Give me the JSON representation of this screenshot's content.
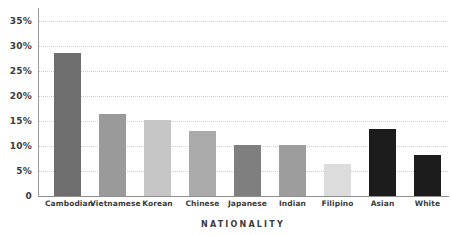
{
  "chart_data": {
    "type": "bar",
    "title": "",
    "xlabel": "NATIONALITY",
    "ylabel": "",
    "categories": [
      "Cambodian",
      "Vietnamese",
      "Korean",
      "Chinese",
      "Japanese",
      "Indian",
      "Filipino",
      "Asian",
      "White"
    ],
    "values": [
      28.7,
      16.4,
      15.2,
      13.1,
      10.3,
      10.3,
      6.5,
      13.5,
      8.3
    ],
    "bar_colors": [
      "#6e6e6e",
      "#9a9a9a",
      "#c6c6c6",
      "#aaaaaa",
      "#7f7f7f",
      "#9d9d9d",
      "#dcdcdc",
      "#1c1c1c",
      "#1c1c1c"
    ],
    "ylim": [
      0,
      37.6
    ],
    "ytick_values": [
      0,
      5,
      10,
      15,
      20,
      25,
      30,
      35
    ],
    "ytick_labels": [
      "0",
      "5%",
      "10%",
      "15%",
      "20%",
      "25%",
      "30%",
      "35%"
    ],
    "gridlines": true,
    "grid_axis": "y",
    "grid_style": "dotted",
    "grid_color": "#cfcfcf",
    "legend": "none",
    "axis_color": "#8f8f8f",
    "text_color": "#3b3b3b",
    "background": "#ffffff"
  }
}
